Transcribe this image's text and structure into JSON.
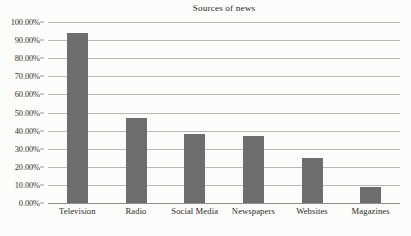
{
  "chart_data": {
    "type": "bar",
    "title": "Sources of news",
    "xlabel": "",
    "ylabel": "",
    "categories": [
      "Television",
      "Radio",
      "Social Media",
      "Newspapers",
      "Websites",
      "Magazines"
    ],
    "values": [
      94,
      47,
      38,
      37,
      25,
      9
    ],
    "value_labels": [
      "94.00%",
      "47.00%",
      "38.00%",
      "37.00%",
      "25.00%",
      "9.00%"
    ],
    "ylim": [
      0,
      100
    ],
    "ytick_values": [
      0,
      10,
      20,
      30,
      40,
      50,
      60,
      70,
      80,
      90,
      100
    ],
    "ytick_labels": [
      "0.00%",
      "10.00%",
      "20.00%",
      "30.00%",
      "40.00%",
      "50.00%",
      "60.00%",
      "70.00%",
      "80.00%",
      "90.00%",
      "100.00%"
    ],
    "grid": true,
    "grid_axis": "y",
    "legend": false,
    "legend_position": "none",
    "series": [
      {
        "name": "Sources of news",
        "values": [
          94,
          47,
          38,
          37,
          25,
          9
        ]
      }
    ],
    "colors": {
      "bar_fill": "#6e6e6e",
      "gridline": "#b9b9b6",
      "axis_line": "#8d8d8a",
      "background": "#fdfdfc",
      "text": "#2b2b27"
    }
  }
}
